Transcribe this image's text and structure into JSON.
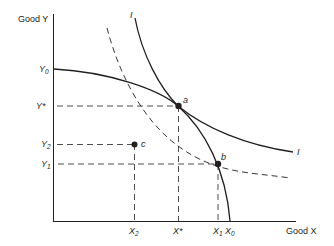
{
  "diagram": {
    "axes": {
      "y_label": "Good Y",
      "x_label": "Good X"
    },
    "y_ticks": [
      {
        "base": "Y",
        "sub": "0",
        "sup": ""
      },
      {
        "base": "Y",
        "sub": "",
        "sup": "*"
      },
      {
        "base": "Y",
        "sub": "2",
        "sup": ""
      },
      {
        "base": "Y",
        "sub": "1",
        "sup": ""
      }
    ],
    "x_ticks": [
      {
        "base": "X",
        "sub": "2",
        "sup": ""
      },
      {
        "base": "X",
        "sub": "",
        "sup": "*"
      },
      {
        "base": "X",
        "sub": "1",
        "sup": ""
      },
      {
        "base": "X",
        "sub": "0",
        "sup": ""
      }
    ],
    "points": [
      {
        "label": "a"
      },
      {
        "label": "b"
      },
      {
        "label": "c"
      }
    ],
    "curves": {
      "indifference_top_label": "I",
      "indifference_right_label": "I"
    },
    "colors": {
      "line": "#231f20",
      "background": "#ffffff"
    }
  }
}
